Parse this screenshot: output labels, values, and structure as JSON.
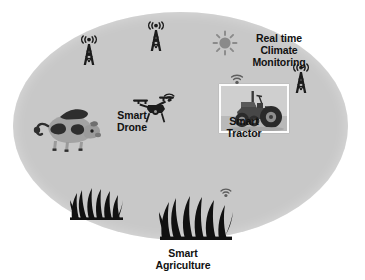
{
  "diagram": {
    "title": "Smart Agriculture",
    "field_color": "#c8c8c8",
    "background_color": "#ffffff",
    "label_color": "#111111"
  },
  "labels": {
    "climate": "Real time\nClimate\nMonitoring",
    "drone": "Smart\nDrone",
    "tractor": "Smart\nTractor",
    "agriculture": "Smart\nAgriculture"
  },
  "icons": {
    "tower_1": "radio-tower-icon",
    "tower_2": "radio-tower-icon",
    "tower_3": "radio-tower-icon",
    "sun": "sun-icon",
    "drone": "drone-icon",
    "cow": "cow-icon",
    "tractor": "tractor-photo",
    "grass_small": "grass-icon",
    "grass_large": "grass-icon",
    "wifi_tractor": "wifi-icon",
    "wifi_drone": "wifi-icon",
    "wifi_grass": "wifi-icon"
  },
  "colors": {
    "icon_dark": "#1c1c1c",
    "sun_grey": "#8a8a8a",
    "cow_grey": "#9a9a9a",
    "cow_dark": "#3a3a3a"
  }
}
